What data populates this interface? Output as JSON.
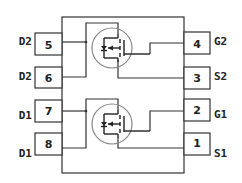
{
  "diagram": {
    "type": "pinout",
    "package_outline": true,
    "colors": {
      "line": "#333333",
      "text": "#222222",
      "circle": "#888888",
      "background": "#ffffff"
    },
    "left_pins": [
      {
        "number": "5",
        "label": "D2"
      },
      {
        "number": "6",
        "label": "D2"
      },
      {
        "number": "7",
        "label": "D1"
      },
      {
        "number": "8",
        "label": "D1"
      }
    ],
    "right_pins": [
      {
        "number": "4",
        "label": "G2"
      },
      {
        "number": "3",
        "label": "S2"
      },
      {
        "number": "2",
        "label": "G1"
      },
      {
        "number": "1",
        "label": "S1"
      }
    ],
    "transistors": [
      {
        "name": "Q2",
        "symbol": "mosfet-n-channel"
      },
      {
        "name": "Q1",
        "symbol": "mosfet-n-channel"
      }
    ]
  }
}
